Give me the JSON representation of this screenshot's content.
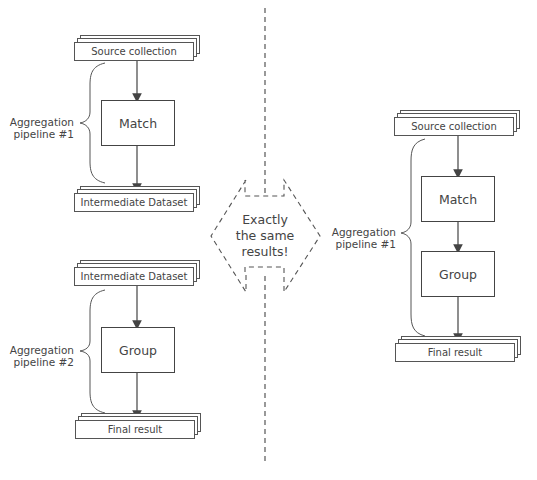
{
  "left": {
    "pipeline1": {
      "source": "Source collection",
      "stage": "Match",
      "output": "Intermediate Dataset",
      "label_line1": "Aggregation",
      "label_line2": "pipeline #1"
    },
    "pipeline2": {
      "source": "Intermediate Dataset",
      "stage": "Group",
      "output": "Final result",
      "label_line1": "Aggregation",
      "label_line2": "pipeline #2"
    }
  },
  "center": {
    "line1": "Exactly",
    "line2": "the same",
    "line3": "results!"
  },
  "right": {
    "source": "Source collection",
    "stage1": "Match",
    "stage2": "Group",
    "output": "Final result",
    "label_line1": "Aggregation",
    "label_line2": "pipeline #1"
  },
  "colors": {
    "stroke": "#444444",
    "text": "#444444",
    "background": "#ffffff"
  }
}
